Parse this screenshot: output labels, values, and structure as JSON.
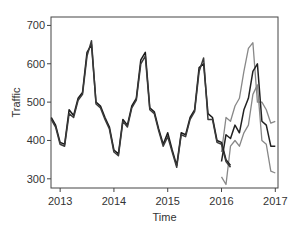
{
  "chart_data": {
    "type": "line",
    "title": "",
    "xlabel": "Time",
    "ylabel": "Traffic",
    "xlim": [
      2012.83,
      2017.05
    ],
    "ylim": [
      276,
      722
    ],
    "xticks": [
      2013,
      2014,
      2015,
      2016,
      2017
    ],
    "xtick_labels": [
      "2013",
      "2014",
      "2015",
      "2016",
      "2017"
    ],
    "yticks": [
      300,
      400,
      500,
      600,
      700
    ],
    "ytick_labels": [
      "300",
      "400",
      "500",
      "600",
      "700"
    ],
    "grid": false,
    "legend": "none",
    "series": [
      {
        "name": "observed",
        "color": "#1a1a1a",
        "start": 2012.833,
        "step": 0.08333,
        "values": [
          460,
          440,
          395,
          390,
          480,
          465,
          510,
          525,
          630,
          650,
          500,
          490,
          460,
          435,
          375,
          365,
          455,
          440,
          490,
          510,
          610,
          630,
          485,
          475,
          430,
          390,
          420,
          375,
          335,
          420,
          415,
          460,
          480,
          590,
          600,
          470,
          460,
          400,
          395,
          350,
          335
        ]
      },
      {
        "name": "fitted",
        "color": "#3a3a3a",
        "start": 2012.833,
        "step": 0.08333,
        "values": [
          455,
          435,
          390,
          385,
          470,
          460,
          505,
          520,
          620,
          660,
          495,
          485,
          455,
          430,
          370,
          360,
          450,
          435,
          485,
          505,
          600,
          620,
          480,
          470,
          425,
          385,
          410,
          370,
          330,
          415,
          410,
          455,
          475,
          580,
          615,
          455,
          455,
          395,
          390,
          345,
          330
        ]
      },
      {
        "name": "forecast",
        "color": "#222222",
        "start": 2016.0,
        "step": 0.08333,
        "values": [
          345,
          415,
          405,
          440,
          420,
          480,
          510,
          580,
          600,
          450,
          440,
          385,
          385
        ]
      },
      {
        "name": "upper-bound",
        "color": "#888888",
        "start": 2016.0,
        "step": 0.08333,
        "values": [
          370,
          460,
          450,
          490,
          510,
          580,
          640,
          655,
          500,
          500,
          480,
          445,
          450
        ]
      },
      {
        "name": "lower-bound",
        "color": "#888888",
        "start": 2016.0,
        "step": 0.08333,
        "values": [
          305,
          285,
          385,
          400,
          385,
          420,
          440,
          520,
          545,
          400,
          390,
          320,
          315
        ]
      }
    ]
  }
}
